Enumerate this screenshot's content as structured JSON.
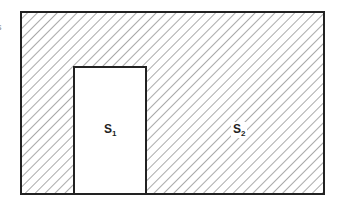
{
  "diagram": {
    "outer_region": {
      "label": "S",
      "subscript": "2",
      "fill": "hatched",
      "stroke": "#222222"
    },
    "inner_region": {
      "label": "S",
      "subscript": "1",
      "fill": "#ffffff",
      "stroke": "#222222"
    },
    "edge_mark": "s"
  }
}
